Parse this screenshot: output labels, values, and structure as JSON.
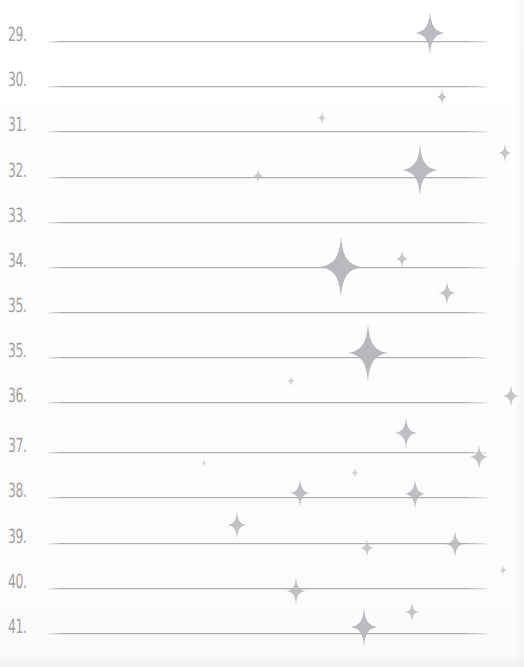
{
  "page": {
    "width": 524,
    "height": 667,
    "background_color": "#fdfdfd",
    "rule_line_color": "#a8a8ac",
    "number_color": "#9a9a9e",
    "sparkle_color": "#b9b9bd"
  },
  "rules": [
    {
      "number": "29.",
      "y": 41,
      "line_x1": 48,
      "line_x2": 487
    },
    {
      "number": "30.",
      "y": 86,
      "line_x1": 48,
      "line_x2": 487
    },
    {
      "number": "31.",
      "y": 131,
      "line_x1": 48,
      "line_x2": 487
    },
    {
      "number": "32.",
      "y": 177,
      "line_x1": 48,
      "line_x2": 487
    },
    {
      "number": "33.",
      "y": 222,
      "line_x1": 48,
      "line_x2": 487
    },
    {
      "number": "34.",
      "y": 267,
      "line_x1": 48,
      "line_x2": 487
    },
    {
      "number": "35.",
      "y": 312,
      "line_x1": 48,
      "line_x2": 487
    },
    {
      "number": "35.",
      "y": 357,
      "line_x1": 48,
      "line_x2": 487
    },
    {
      "number": "36.",
      "y": 402,
      "line_x1": 48,
      "line_x2": 487
    },
    {
      "number": "37.",
      "y": 452,
      "line_x1": 48,
      "line_x2": 487
    },
    {
      "number": "38.",
      "y": 497,
      "line_x1": 48,
      "line_x2": 487
    },
    {
      "number": "39.",
      "y": 543,
      "line_x1": 48,
      "line_x2": 487
    },
    {
      "number": "40.",
      "y": 588,
      "line_x1": 48,
      "line_x2": 487
    },
    {
      "number": "41.",
      "y": 633,
      "line_x1": 48,
      "line_x2": 487
    }
  ],
  "sparkles": [
    {
      "name": "sparkle-1",
      "x": 430,
      "y": 33,
      "size": 30,
      "opacity": 0.95
    },
    {
      "name": "sparkle-2",
      "x": 442,
      "y": 97,
      "size": 11,
      "opacity": 0.85
    },
    {
      "name": "sparkle-3",
      "x": 322,
      "y": 118,
      "size": 9,
      "opacity": 0.72
    },
    {
      "name": "sparkle-4",
      "x": 505,
      "y": 153,
      "size": 13,
      "opacity": 0.8
    },
    {
      "name": "sparkle-5",
      "x": 420,
      "y": 170,
      "size": 36,
      "opacity": 0.97
    },
    {
      "name": "sparkle-6",
      "x": 258,
      "y": 176,
      "size": 11,
      "opacity": 0.7
    },
    {
      "name": "sparkle-7",
      "x": 341,
      "y": 267,
      "size": 42,
      "opacity": 1.0
    },
    {
      "name": "sparkle-8",
      "x": 402,
      "y": 259,
      "size": 13,
      "opacity": 0.78
    },
    {
      "name": "sparkle-9",
      "x": 447,
      "y": 293,
      "size": 17,
      "opacity": 0.85
    },
    {
      "name": "sparkle-10",
      "x": 368,
      "y": 353,
      "size": 40,
      "opacity": 1.0
    },
    {
      "name": "sparkle-11",
      "x": 291,
      "y": 381,
      "size": 8,
      "opacity": 0.66
    },
    {
      "name": "sparkle-12",
      "x": 511,
      "y": 396,
      "size": 16,
      "opacity": 0.82
    },
    {
      "name": "sparkle-13",
      "x": 406,
      "y": 433,
      "size": 22,
      "opacity": 0.9
    },
    {
      "name": "sparkle-14",
      "x": 355,
      "y": 473,
      "size": 8,
      "opacity": 0.66
    },
    {
      "name": "sparkle-15",
      "x": 479,
      "y": 457,
      "size": 18,
      "opacity": 0.86
    },
    {
      "name": "sparkle-16",
      "x": 300,
      "y": 493,
      "size": 20,
      "opacity": 0.9
    },
    {
      "name": "sparkle-17",
      "x": 415,
      "y": 494,
      "size": 21,
      "opacity": 0.9
    },
    {
      "name": "sparkle-18",
      "x": 237,
      "y": 525,
      "size": 19,
      "opacity": 0.88
    },
    {
      "name": "sparkle-19",
      "x": 367,
      "y": 548,
      "size": 13,
      "opacity": 0.78
    },
    {
      "name": "sparkle-20",
      "x": 455,
      "y": 544,
      "size": 19,
      "opacity": 0.88
    },
    {
      "name": "sparkle-21",
      "x": 503,
      "y": 570,
      "size": 8,
      "opacity": 0.64
    },
    {
      "name": "sparkle-22",
      "x": 296,
      "y": 591,
      "size": 19,
      "opacity": 0.88
    },
    {
      "name": "sparkle-23",
      "x": 412,
      "y": 612,
      "size": 14,
      "opacity": 0.8
    },
    {
      "name": "sparkle-24",
      "x": 364,
      "y": 627,
      "size": 27,
      "opacity": 0.95
    },
    {
      "name": "sparkle-25",
      "x": 204,
      "y": 463,
      "size": 6,
      "opacity": 0.55
    }
  ]
}
